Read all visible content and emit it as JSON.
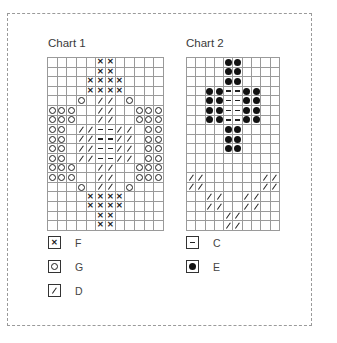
{
  "chart1": {
    "title": "Chart 1",
    "cols": 12,
    "rows": [
      ".....XX.....",
      ".....XX.....",
      "....XXXX....",
      "....XXXX....",
      "...O.SS.O...",
      "OOO..SS..OOO",
      "OOO..SS..OOO",
      "OO.SSDDSS.OO",
      "OO.SSDDSS.OO",
      "OO.SSDDSS.OO",
      "OO.SSDDSS.OO",
      "OOO..SS..OOO",
      "OOO..SS..OOO",
      "...O.SS.O...",
      "....XXXX....",
      "....XXXX....",
      ".....XX.....",
      ".....XX....."
    ]
  },
  "chart2": {
    "title": "Chart 2",
    "cols": 10,
    "rows": [
      "....EE....",
      "....EE....",
      "....EE....",
      "..EEDDEE..",
      "..EEDDEE..",
      "..EEDDEE..",
      "..EEDDEE..",
      "....EE....",
      "....EE....",
      "....EE....",
      "..........",
      "..........",
      "SS......SS",
      "SS......SS",
      "..SS..SS..",
      "..SS..SS..",
      "....SS....",
      "....SS...."
    ]
  },
  "legend1": [
    {
      "symbol": "X",
      "icon": "cross-icon",
      "label": "F"
    },
    {
      "symbol": "O",
      "icon": "open-circle-icon",
      "label": "G"
    },
    {
      "symbol": "S",
      "icon": "slash-icon",
      "label": "D"
    }
  ],
  "legend2": [
    {
      "symbol": "D",
      "icon": "dash-icon",
      "label": "C"
    },
    {
      "symbol": "E",
      "icon": "filled-dot-icon",
      "label": "E"
    }
  ]
}
